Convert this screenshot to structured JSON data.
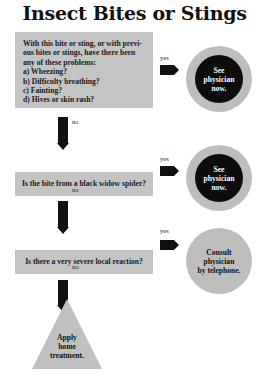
{
  "title": "Insect Bites or Stings",
  "questions": [
    {
      "lines": [
        "With this bite or sting, or with previ-",
        "ous bites or stings, have there been",
        "any of these problems:",
        "a) Wheezing?",
        "b) Difficulty breathing?",
        "c) Fainting?",
        "d) Hives or skin rash?"
      ]
    },
    {
      "text": "Is the bite from a black widow spider?"
    },
    {
      "text": "Is there a very severe local reaction?"
    }
  ],
  "branch_labels": {
    "yes": "yes",
    "no": "no"
  },
  "outcomes": [
    {
      "lines": [
        "See",
        "physician",
        "now."
      ]
    },
    {
      "lines": [
        "See",
        "physician",
        "now."
      ]
    },
    {
      "lines": [
        "Consult",
        "physician",
        "by telephone."
      ]
    }
  ],
  "final": {
    "lines": [
      "Apply",
      "home",
      "treatment."
    ]
  },
  "colors": {
    "box": "#c4c4c4",
    "arrow": "#111111",
    "circle_outer": "#bdbdbd",
    "circle_inner": "#0d0d0d"
  }
}
